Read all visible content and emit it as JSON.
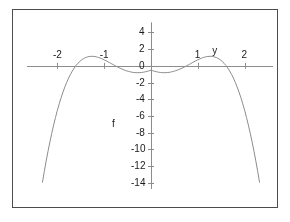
{
  "figure": {
    "background_color": "#ffffff",
    "frame_color": "#4c4c4c",
    "curve_color": "#8c8c8c",
    "axis_color": "#8c8c8c",
    "text_color": "#1a1a1a"
  },
  "chart_data": {
    "type": "line",
    "title": "",
    "xlabel": "y",
    "ylabel": "f",
    "xlim": [
      -2.35,
      2.35
    ],
    "ylim": [
      -15.2,
      5.0
    ],
    "grid": false,
    "legend": null,
    "x_ticks": [
      -2,
      -1,
      1,
      2
    ],
    "x_tick_labels": [
      "-2",
      "-1",
      "1",
      "2"
    ],
    "y_ticks": [
      4,
      2,
      0,
      -2,
      -4,
      -6,
      -8,
      -10,
      -12,
      -14
    ],
    "y_tick_labels": [
      "4",
      "2",
      "0",
      "-2",
      "-4",
      "-6",
      "-8",
      "-10",
      "-12",
      "-14"
    ],
    "series": [
      {
        "name": "f",
        "x": [
          -2.32,
          -2.28,
          -2.24,
          -2.2,
          -2.16,
          -2.12,
          -2.08,
          -2.04,
          -2.0,
          -1.96,
          -1.92,
          -1.88,
          -1.84,
          -1.8,
          -1.76,
          -1.72,
          -1.68,
          -1.64,
          -1.6,
          -1.56,
          -1.52,
          -1.48,
          -1.44,
          -1.4,
          -1.36,
          -1.32,
          -1.28,
          -1.24,
          -1.2,
          -1.16,
          -1.12,
          -1.08,
          -1.04,
          -1.0,
          -0.96,
          -0.92,
          -0.88,
          -0.84,
          -0.8,
          -0.76,
          -0.72,
          -0.68,
          -0.64,
          -0.6,
          -0.56,
          -0.52,
          -0.48,
          -0.44,
          -0.4,
          -0.36,
          -0.32,
          -0.28,
          -0.24,
          -0.2,
          -0.16,
          -0.12,
          -0.08,
          -0.04,
          0.0,
          0.04,
          0.08,
          0.12,
          0.16,
          0.2,
          0.24,
          0.28,
          0.32,
          0.36,
          0.4,
          0.44,
          0.48,
          0.52,
          0.56,
          0.6,
          0.64,
          0.68,
          0.72,
          0.76,
          0.8,
          0.84,
          0.88,
          0.92,
          0.96,
          1.0,
          1.04,
          1.08,
          1.12,
          1.16,
          1.2,
          1.24,
          1.28,
          1.32,
          1.36,
          1.4,
          1.44,
          1.48,
          1.52,
          1.56,
          1.6,
          1.64,
          1.68,
          1.72,
          1.76,
          1.8,
          1.84,
          1.88,
          1.92,
          1.96,
          2.0,
          2.04,
          2.08,
          2.12,
          2.16,
          2.2,
          2.24,
          2.28,
          2.32
        ],
        "y": [
          -13.96,
          -12.64,
          -11.39,
          -10.21,
          -9.1,
          -8.06,
          -7.08,
          -6.17,
          -5.32,
          -4.53,
          -3.8,
          -3.13,
          -2.52,
          -1.97,
          -1.46,
          -1.01,
          -0.61,
          -0.26,
          0.05,
          0.31,
          0.53,
          0.72,
          0.87,
          0.98,
          1.06,
          1.11,
          1.14,
          1.13,
          1.11,
          1.06,
          1.0,
          0.92,
          0.82,
          0.72,
          0.61,
          0.49,
          0.37,
          0.24,
          0.12,
          0.0,
          -0.12,
          -0.23,
          -0.33,
          -0.43,
          -0.52,
          -0.6,
          -0.66,
          -0.72,
          -0.77,
          -0.8,
          -0.82,
          -0.82,
          -0.81,
          -0.79,
          -0.76,
          -0.71,
          -0.66,
          -0.59,
          -0.52,
          -0.59,
          -0.66,
          -0.71,
          -0.76,
          -0.79,
          -0.81,
          -0.82,
          -0.82,
          -0.8,
          -0.77,
          -0.72,
          -0.66,
          -0.6,
          -0.52,
          -0.43,
          -0.33,
          -0.23,
          -0.12,
          0.0,
          0.12,
          0.24,
          0.37,
          0.49,
          0.61,
          0.72,
          0.82,
          0.92,
          1.0,
          1.06,
          1.11,
          1.13,
          1.14,
          1.11,
          1.06,
          0.98,
          0.87,
          0.72,
          0.53,
          0.31,
          0.05,
          -0.26,
          -0.61,
          -1.01,
          -1.46,
          -1.97,
          -2.52,
          -3.13,
          -3.8,
          -4.53,
          -5.32,
          -6.17,
          -7.08,
          -8.06,
          -9.1,
          -10.21,
          -11.39,
          -12.64,
          -13.96
        ],
        "color": "#8c8c8c"
      }
    ],
    "features": {
      "zeros": [
        -2,
        0,
        2
      ],
      "local_maxima": [
        {
          "x": -1.28,
          "y": 4
        },
        {
          "x": 1.28,
          "y": 4
        }
      ],
      "local_minimum": {
        "x": 0,
        "y": 0
      },
      "symmetry": "even"
    }
  }
}
